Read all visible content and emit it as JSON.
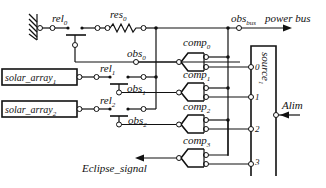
{
  "diagram": {
    "colors": {
      "stroke": "#111111",
      "background": "#ffffff"
    },
    "ground": {
      "label": "",
      "icon": "ground-hatch-icon"
    },
    "relays": [
      {
        "id": "rel0",
        "base": "rel",
        "sub": "0"
      },
      {
        "id": "rel1",
        "base": "rel",
        "sub": "1"
      },
      {
        "id": "rel2",
        "base": "rel",
        "sub": "2"
      }
    ],
    "resistor": {
      "base": "res",
      "sub": "0"
    },
    "observers": [
      {
        "id": "obs0",
        "base": "obs",
        "sub": "0"
      },
      {
        "id": "obs1",
        "base": "obs",
        "sub": "1"
      },
      {
        "id": "obs2",
        "base": "obs",
        "sub": "2"
      },
      {
        "id": "obsbus",
        "base": "obs",
        "sub": "bus"
      }
    ],
    "power_bus": {
      "label": "power bus"
    },
    "solar_arrays": [
      {
        "base": "solar_array",
        "sub": "1"
      },
      {
        "base": "solar_array",
        "sub": "2"
      }
    ],
    "comparators": [
      {
        "base": "comp",
        "sub": "0"
      },
      {
        "base": "comp",
        "sub": "1"
      },
      {
        "base": "comp",
        "sub": "2"
      },
      {
        "base": "comp",
        "sub": "3"
      }
    ],
    "source": {
      "base": "source",
      "sub": "1",
      "ports": [
        "0",
        "1",
        "2",
        "3"
      ]
    },
    "alim": {
      "label": "Alim"
    },
    "eclipse": {
      "label": "Eclipse_signal"
    }
  }
}
